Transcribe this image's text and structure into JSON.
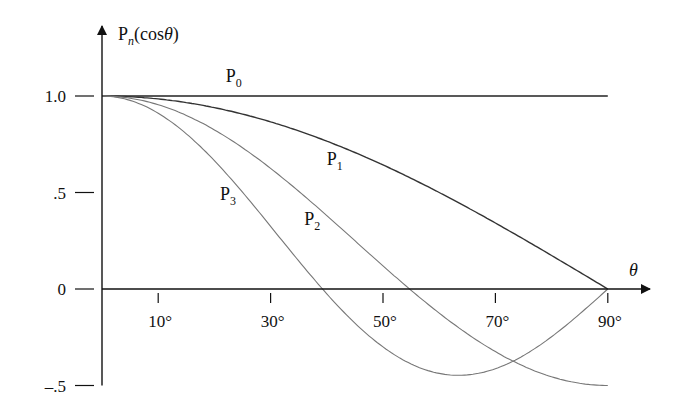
{
  "chart_data": {
    "type": "line",
    "title": "",
    "xlabel": "θ",
    "ylabel": "P_n(cosθ)",
    "ylabel_parts": {
      "base": "P",
      "sub": "n",
      "rest": "(cos",
      "theta": "θ",
      "close": ")"
    },
    "x_unit": "degrees",
    "xlim": [
      0,
      90
    ],
    "ylim": [
      -0.5,
      1.0
    ],
    "grid": false,
    "legend": "inline labels on curves",
    "x_ticks": [
      {
        "value": 10,
        "label": "10°"
      },
      {
        "value": 30,
        "label": "30°"
      },
      {
        "value": 50,
        "label": "50°"
      },
      {
        "value": 70,
        "label": "70°"
      },
      {
        "value": 90,
        "label": "90°"
      }
    ],
    "y_ticks": [
      {
        "value": 1.0,
        "label": "1.0"
      },
      {
        "value": 0.5,
        "label": ".5"
      },
      {
        "value": 0,
        "label": "0"
      },
      {
        "value": -0.5,
        "label": "–.5"
      }
    ],
    "x": [
      0,
      10,
      20,
      30,
      40,
      50,
      60,
      70,
      80,
      90
    ],
    "series": [
      {
        "name": "P0",
        "label_base": "P",
        "label_sub": "0",
        "formula": "1",
        "values": [
          1.0,
          1.0,
          1.0,
          1.0,
          1.0,
          1.0,
          1.0,
          1.0,
          1.0,
          1.0
        ],
        "color": "#222222",
        "width": 1.4,
        "label_pos": {
          "theta": 22,
          "value": 1.07
        }
      },
      {
        "name": "P1",
        "label_base": "P",
        "label_sub": "1",
        "formula": "cosθ",
        "values": [
          1.0,
          0.985,
          0.94,
          0.866,
          0.766,
          0.643,
          0.5,
          0.342,
          0.174,
          0.0
        ],
        "color": "#333333",
        "width": 1.4,
        "label_pos": {
          "theta": 40,
          "value": 0.64
        }
      },
      {
        "name": "P2",
        "label_base": "P",
        "label_sub": "2",
        "formula": "(3cos²θ−1)/2",
        "values": [
          1.0,
          0.955,
          0.824,
          0.625,
          0.38,
          0.12,
          -0.125,
          -0.325,
          -0.455,
          -0.5
        ],
        "color": "#777777",
        "width": 1.1,
        "label_pos": {
          "theta": 36,
          "value": 0.33
        }
      },
      {
        "name": "P3",
        "label_base": "P",
        "label_sub": "3",
        "formula": "(5cos³θ−3cosθ)/2",
        "values": [
          1.0,
          0.911,
          0.665,
          0.325,
          -0.025,
          -0.3,
          -0.4375,
          -0.413,
          -0.247,
          0.0
        ],
        "color": "#777777",
        "width": 1.1,
        "label_pos": {
          "theta": 21,
          "value": 0.46
        }
      }
    ]
  },
  "layout": {
    "origin_px": {
      "x": 102,
      "y": 289
    },
    "px_per_degree": 5.62,
    "px_per_unit": 193
  }
}
